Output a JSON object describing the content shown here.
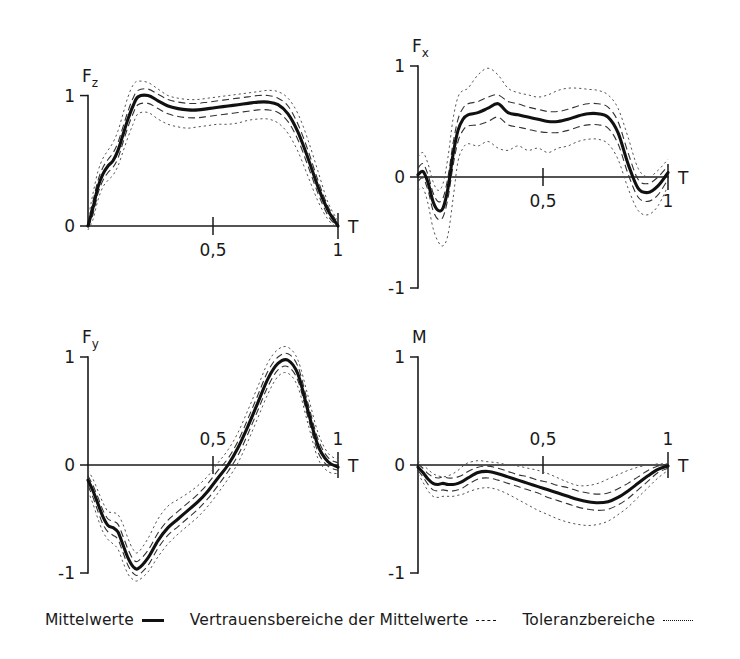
{
  "figure": {
    "border_color": "#2a2a2a",
    "background": "#ffffff"
  },
  "legend": {
    "entries": [
      {
        "label": "Mittelwerte",
        "style": "solid"
      },
      {
        "label": "Vertrauensbereiche der Mittelwerte",
        "style": "dashed"
      },
      {
        "label": "Toleranzbereiche",
        "style": "dotted"
      }
    ]
  },
  "chart_data": [
    {
      "type": "line",
      "id": "fz",
      "title": "Fz",
      "ylabel_main": "F",
      "ylabel_sub": "z",
      "xlabel": "T",
      "xlim": [
        0,
        1
      ],
      "ylim": [
        0,
        1.15
      ],
      "yticks": [
        0,
        1
      ],
      "ytick_labels": [
        "0",
        "1"
      ],
      "xticks": [
        0.5,
        1
      ],
      "xtick_labels": [
        "0,5",
        "1"
      ],
      "xtick_label_pos": "below",
      "grid": false,
      "legend_position": "figure-bottom",
      "x": [
        0.0,
        0.02,
        0.04,
        0.06,
        0.08,
        0.1,
        0.12,
        0.14,
        0.16,
        0.18,
        0.2,
        0.24,
        0.28,
        0.32,
        0.36,
        0.4,
        0.44,
        0.48,
        0.52,
        0.56,
        0.6,
        0.64,
        0.68,
        0.72,
        0.76,
        0.8,
        0.84,
        0.88,
        0.92,
        0.96,
        1.0
      ],
      "series": [
        {
          "name": "Mittelwerte",
          "style": "solid",
          "values": [
            0.0,
            0.14,
            0.3,
            0.4,
            0.46,
            0.5,
            0.58,
            0.7,
            0.82,
            0.92,
            0.99,
            1.0,
            0.96,
            0.92,
            0.9,
            0.89,
            0.89,
            0.9,
            0.91,
            0.92,
            0.93,
            0.94,
            0.95,
            0.95,
            0.93,
            0.86,
            0.72,
            0.52,
            0.3,
            0.12,
            0.0
          ]
        },
        {
          "name": "Vertrauensbereich oben",
          "style": "dashed",
          "values": [
            0.02,
            0.19,
            0.35,
            0.45,
            0.51,
            0.56,
            0.64,
            0.76,
            0.88,
            0.98,
            1.04,
            1.05,
            1.01,
            0.97,
            0.95,
            0.94,
            0.94,
            0.95,
            0.96,
            0.97,
            0.98,
            0.99,
            1.0,
            1.0,
            0.98,
            0.92,
            0.78,
            0.58,
            0.35,
            0.15,
            0.02
          ]
        },
        {
          "name": "Vertrauensbereich unten",
          "style": "dashed",
          "values": [
            -0.01,
            0.09,
            0.25,
            0.35,
            0.41,
            0.45,
            0.52,
            0.64,
            0.76,
            0.86,
            0.93,
            0.94,
            0.9,
            0.86,
            0.84,
            0.83,
            0.83,
            0.84,
            0.85,
            0.86,
            0.87,
            0.88,
            0.89,
            0.89,
            0.87,
            0.8,
            0.66,
            0.46,
            0.25,
            0.08,
            -0.01
          ]
        },
        {
          "name": "Toleranzbereich oben",
          "style": "dotted",
          "values": [
            0.05,
            0.25,
            0.42,
            0.52,
            0.58,
            0.64,
            0.73,
            0.86,
            0.99,
            1.08,
            1.11,
            1.1,
            1.05,
            1.0,
            0.98,
            0.97,
            0.97,
            0.98,
            0.99,
            1.0,
            1.01,
            1.02,
            1.03,
            1.04,
            1.03,
            0.98,
            0.86,
            0.66,
            0.42,
            0.18,
            0.04
          ]
        },
        {
          "name": "Toleranzbereich unten",
          "style": "dotted",
          "values": [
            -0.03,
            0.05,
            0.2,
            0.3,
            0.35,
            0.39,
            0.46,
            0.57,
            0.68,
            0.78,
            0.86,
            0.87,
            0.82,
            0.78,
            0.76,
            0.75,
            0.76,
            0.77,
            0.78,
            0.78,
            0.79,
            0.81,
            0.82,
            0.82,
            0.79,
            0.71,
            0.57,
            0.38,
            0.19,
            0.05,
            -0.02
          ]
        }
      ]
    },
    {
      "type": "line",
      "id": "fx",
      "title": "Fx",
      "ylabel_main": "F",
      "ylabel_sub": "x",
      "xlabel": "T",
      "xlim": [
        0,
        1
      ],
      "ylim": [
        -1,
        1
      ],
      "yticks": [
        -1,
        0,
        1
      ],
      "ytick_labels": [
        "-1",
        "0",
        "1"
      ],
      "xticks": [
        0.5,
        1
      ],
      "xtick_labels": [
        "0,5",
        "1"
      ],
      "xtick_label_pos": "below",
      "grid": false,
      "legend_position": "figure-bottom",
      "x": [
        0.0,
        0.02,
        0.04,
        0.06,
        0.08,
        0.1,
        0.12,
        0.14,
        0.16,
        0.18,
        0.2,
        0.24,
        0.28,
        0.32,
        0.36,
        0.4,
        0.44,
        0.48,
        0.52,
        0.56,
        0.6,
        0.64,
        0.68,
        0.72,
        0.76,
        0.8,
        0.84,
        0.88,
        0.92,
        0.96,
        1.0
      ],
      "series": [
        {
          "name": "Mittelwerte",
          "style": "solid",
          "values": [
            0.02,
            0.05,
            -0.05,
            -0.22,
            -0.3,
            -0.28,
            -0.1,
            0.2,
            0.42,
            0.52,
            0.56,
            0.58,
            0.62,
            0.66,
            0.58,
            0.56,
            0.54,
            0.52,
            0.5,
            0.5,
            0.52,
            0.55,
            0.57,
            0.57,
            0.54,
            0.4,
            0.12,
            -0.1,
            -0.14,
            -0.08,
            0.04
          ]
        },
        {
          "name": "Vertrauensbereich oben",
          "style": "dashed",
          "values": [
            0.08,
            0.12,
            0.02,
            -0.14,
            -0.22,
            -0.19,
            0.0,
            0.3,
            0.52,
            0.62,
            0.66,
            0.68,
            0.72,
            0.74,
            0.68,
            0.66,
            0.63,
            0.61,
            0.59,
            0.59,
            0.61,
            0.64,
            0.66,
            0.66,
            0.63,
            0.5,
            0.22,
            -0.02,
            -0.06,
            0.0,
            0.1
          ]
        },
        {
          "name": "Vertrauensbereich unten",
          "style": "dashed",
          "values": [
            -0.04,
            -0.01,
            -0.12,
            -0.3,
            -0.38,
            -0.36,
            -0.19,
            0.1,
            0.32,
            0.42,
            0.46,
            0.47,
            0.5,
            0.54,
            0.47,
            0.45,
            0.43,
            0.41,
            0.4,
            0.4,
            0.42,
            0.45,
            0.47,
            0.47,
            0.44,
            0.3,
            0.03,
            -0.18,
            -0.22,
            -0.16,
            -0.02
          ]
        },
        {
          "name": "Toleranzbereich oben",
          "style": "dotted",
          "values": [
            0.18,
            0.22,
            0.12,
            -0.04,
            -0.12,
            -0.06,
            0.18,
            0.52,
            0.72,
            0.78,
            0.8,
            0.92,
            0.98,
            0.92,
            0.8,
            0.76,
            0.74,
            0.72,
            0.74,
            0.78,
            0.8,
            0.8,
            0.79,
            0.78,
            0.74,
            0.62,
            0.36,
            0.08,
            0.0,
            0.06,
            0.16
          ]
        },
        {
          "name": "Toleranzbereich unten",
          "style": "dotted",
          "values": [
            -0.12,
            -0.1,
            -0.24,
            -0.46,
            -0.58,
            -0.62,
            -0.52,
            -0.2,
            0.14,
            0.26,
            0.3,
            0.28,
            0.32,
            0.26,
            0.24,
            0.28,
            0.24,
            0.26,
            0.22,
            0.26,
            0.28,
            0.32,
            0.34,
            0.34,
            0.3,
            0.16,
            -0.1,
            -0.3,
            -0.34,
            -0.26,
            -0.08
          ]
        }
      ]
    },
    {
      "type": "line",
      "id": "fy",
      "title": "Fy",
      "ylabel_main": "F",
      "ylabel_sub": "y",
      "xlabel": "T",
      "xlim": [
        0,
        1
      ],
      "ylim": [
        -1,
        1
      ],
      "yticks": [
        -1,
        0,
        1
      ],
      "ytick_labels": [
        "-1",
        "0",
        "1"
      ],
      "xticks": [
        0.5,
        1
      ],
      "xtick_labels": [
        "0,5",
        "1"
      ],
      "xtick_label_pos": "above",
      "grid": false,
      "legend_position": "figure-bottom",
      "x": [
        0.0,
        0.02,
        0.04,
        0.06,
        0.08,
        0.1,
        0.12,
        0.14,
        0.16,
        0.18,
        0.2,
        0.24,
        0.28,
        0.32,
        0.36,
        0.4,
        0.44,
        0.48,
        0.52,
        0.56,
        0.6,
        0.64,
        0.68,
        0.72,
        0.76,
        0.8,
        0.84,
        0.88,
        0.92,
        0.96,
        1.0
      ],
      "series": [
        {
          "name": "Mittelwerte",
          "style": "solid",
          "values": [
            -0.14,
            -0.24,
            -0.36,
            -0.48,
            -0.56,
            -0.58,
            -0.62,
            -0.74,
            -0.86,
            -0.94,
            -0.96,
            -0.86,
            -0.7,
            -0.58,
            -0.5,
            -0.42,
            -0.34,
            -0.24,
            -0.12,
            0.0,
            0.16,
            0.36,
            0.58,
            0.8,
            0.94,
            0.97,
            0.84,
            0.5,
            0.18,
            0.03,
            -0.02
          ]
        },
        {
          "name": "Vertrauensbereich oben",
          "style": "dashed",
          "values": [
            -0.1,
            -0.19,
            -0.3,
            -0.42,
            -0.5,
            -0.52,
            -0.55,
            -0.66,
            -0.78,
            -0.87,
            -0.89,
            -0.79,
            -0.63,
            -0.51,
            -0.43,
            -0.35,
            -0.27,
            -0.17,
            -0.05,
            0.06,
            0.22,
            0.43,
            0.65,
            0.87,
            1.0,
            1.03,
            0.91,
            0.57,
            0.24,
            0.07,
            0.02
          ]
        },
        {
          "name": "Vertrauensbereich unten",
          "style": "dashed",
          "values": [
            -0.19,
            -0.3,
            -0.43,
            -0.55,
            -0.62,
            -0.65,
            -0.69,
            -0.81,
            -0.93,
            -1.0,
            -1.02,
            -0.93,
            -0.77,
            -0.65,
            -0.57,
            -0.49,
            -0.41,
            -0.31,
            -0.19,
            -0.06,
            0.09,
            0.29,
            0.51,
            0.73,
            0.88,
            0.91,
            0.78,
            0.44,
            0.12,
            -0.01,
            -0.05
          ]
        },
        {
          "name": "Toleranzbereich oben",
          "style": "dotted",
          "values": [
            -0.05,
            -0.13,
            -0.24,
            -0.35,
            -0.43,
            -0.44,
            -0.46,
            -0.55,
            -0.68,
            -0.78,
            -0.81,
            -0.68,
            -0.5,
            -0.38,
            -0.32,
            -0.26,
            -0.19,
            -0.1,
            0.02,
            0.14,
            0.3,
            0.51,
            0.73,
            0.95,
            1.07,
            1.09,
            0.97,
            0.64,
            0.3,
            0.11,
            0.05
          ]
        },
        {
          "name": "Toleranzbereich unten",
          "style": "dotted",
          "values": [
            -0.24,
            -0.36,
            -0.5,
            -0.62,
            -0.69,
            -0.73,
            -0.78,
            -0.9,
            -1.01,
            -1.06,
            -1.07,
            -0.99,
            -0.85,
            -0.73,
            -0.64,
            -0.56,
            -0.48,
            -0.38,
            -0.26,
            -0.13,
            0.02,
            0.22,
            0.44,
            0.66,
            0.82,
            0.85,
            0.72,
            0.38,
            0.06,
            -0.06,
            -0.08
          ]
        }
      ]
    },
    {
      "type": "line",
      "id": "m",
      "title": "M",
      "ylabel_main": "M",
      "ylabel_sub": "",
      "xlabel": "T",
      "xlim": [
        0,
        1
      ],
      "ylim": [
        -1,
        1
      ],
      "yticks": [
        -1,
        0,
        1
      ],
      "ytick_labels": [
        "-1",
        "0",
        "1"
      ],
      "xticks": [
        0.5,
        1
      ],
      "xtick_labels": [
        "0,5",
        "1"
      ],
      "xtick_label_pos": "above",
      "grid": false,
      "legend_position": "figure-bottom",
      "x": [
        0.0,
        0.02,
        0.04,
        0.06,
        0.08,
        0.1,
        0.12,
        0.14,
        0.16,
        0.18,
        0.2,
        0.24,
        0.28,
        0.32,
        0.36,
        0.4,
        0.44,
        0.48,
        0.52,
        0.56,
        0.6,
        0.64,
        0.68,
        0.72,
        0.76,
        0.8,
        0.84,
        0.88,
        0.92,
        0.96,
        1.0
      ],
      "series": [
        {
          "name": "Mittelwerte",
          "style": "solid",
          "values": [
            -0.02,
            -0.07,
            -0.13,
            -0.17,
            -0.18,
            -0.17,
            -0.18,
            -0.18,
            -0.17,
            -0.15,
            -0.12,
            -0.07,
            -0.06,
            -0.08,
            -0.11,
            -0.14,
            -0.17,
            -0.2,
            -0.23,
            -0.26,
            -0.29,
            -0.32,
            -0.34,
            -0.35,
            -0.34,
            -0.3,
            -0.24,
            -0.17,
            -0.1,
            -0.04,
            -0.01
          ]
        },
        {
          "name": "Vertrauensbereich oben",
          "style": "dashed",
          "values": [
            0.01,
            -0.03,
            -0.08,
            -0.11,
            -0.12,
            -0.11,
            -0.12,
            -0.12,
            -0.11,
            -0.09,
            -0.06,
            -0.02,
            -0.01,
            -0.03,
            -0.06,
            -0.09,
            -0.11,
            -0.14,
            -0.16,
            -0.19,
            -0.21,
            -0.24,
            -0.26,
            -0.27,
            -0.26,
            -0.22,
            -0.17,
            -0.11,
            -0.05,
            -0.01,
            0.01
          ]
        },
        {
          "name": "Vertrauensbereich unten",
          "style": "dashed",
          "values": [
            -0.05,
            -0.11,
            -0.18,
            -0.23,
            -0.24,
            -0.23,
            -0.24,
            -0.24,
            -0.23,
            -0.21,
            -0.18,
            -0.13,
            -0.12,
            -0.14,
            -0.17,
            -0.2,
            -0.23,
            -0.26,
            -0.3,
            -0.33,
            -0.36,
            -0.39,
            -0.41,
            -0.42,
            -0.41,
            -0.37,
            -0.31,
            -0.23,
            -0.15,
            -0.07,
            -0.03
          ]
        },
        {
          "name": "Toleranzbereich oben",
          "style": "dotted",
          "values": [
            0.04,
            0.0,
            -0.04,
            -0.08,
            -0.1,
            -0.11,
            -0.1,
            -0.08,
            -0.05,
            -0.01,
            0.02,
            0.04,
            0.03,
            0.02,
            0.0,
            -0.01,
            -0.03,
            -0.05,
            -0.08,
            -0.12,
            -0.16,
            -0.19,
            -0.19,
            -0.17,
            -0.13,
            -0.09,
            -0.05,
            -0.02,
            0.0,
            0.01,
            0.01
          ]
        },
        {
          "name": "Toleranzbereich unten",
          "style": "dotted",
          "values": [
            -0.08,
            -0.16,
            -0.24,
            -0.29,
            -0.3,
            -0.29,
            -0.29,
            -0.29,
            -0.28,
            -0.27,
            -0.25,
            -0.22,
            -0.21,
            -0.23,
            -0.27,
            -0.32,
            -0.37,
            -0.42,
            -0.46,
            -0.5,
            -0.53,
            -0.55,
            -0.56,
            -0.55,
            -0.52,
            -0.46,
            -0.39,
            -0.3,
            -0.21,
            -0.12,
            -0.05
          ]
        }
      ]
    }
  ]
}
